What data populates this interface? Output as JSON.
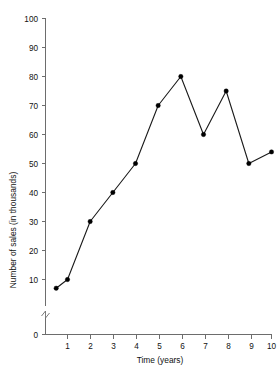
{
  "chart_data": {
    "type": "line",
    "title": "",
    "subtitle": "",
    "xlabel": "Time (years)",
    "ylabel": "Number of sales (in thousands)",
    "x": [
      0.5,
      1,
      2,
      3,
      4,
      5,
      6,
      7,
      8,
      9,
      10
    ],
    "values": [
      7,
      10,
      30,
      40,
      50,
      70,
      80,
      60,
      75,
      50,
      54
    ],
    "series": [
      {
        "name": "Number of sales",
        "values": [
          7,
          10,
          30,
          40,
          50,
          70,
          80,
          60,
          75,
          50,
          54
        ]
      }
    ],
    "xticks": [
      "1",
      "2",
      "3",
      "4",
      "5",
      "6",
      "7",
      "8",
      "9",
      "10"
    ],
    "xtick_values": [
      1,
      2,
      3,
      4,
      5,
      6,
      7,
      8,
      9,
      10
    ],
    "yticks": [
      "0",
      "10",
      "20",
      "30",
      "40",
      "50",
      "60",
      "70",
      "80",
      "90",
      "100"
    ],
    "ytick_values": [
      0,
      10,
      20,
      30,
      40,
      50,
      60,
      70,
      80,
      90,
      100
    ],
    "xlim": [
      0,
      10.5
    ],
    "ylim": [
      0,
      100
    ],
    "y_axis_break": true,
    "y_axis_break_between": [
      0,
      10
    ],
    "grid": false,
    "legend": false,
    "legend_position": "none",
    "marker": "filled-circle",
    "line_color": "#1a1a1a",
    "marker_color": "#000000",
    "axis_color": "#6d6d6d"
  },
  "axis_labels": {
    "y": [
      "100",
      "90",
      "80",
      "70",
      "60",
      "50",
      "40",
      "30",
      "20",
      "10",
      "0"
    ],
    "x": [
      "1",
      "2",
      "3",
      "4",
      "5",
      "6",
      "7",
      "8",
      "9",
      "10"
    ]
  },
  "titles": {
    "x_axis": "Time (years)",
    "y_axis": "Number of sales (in thousands)"
  }
}
